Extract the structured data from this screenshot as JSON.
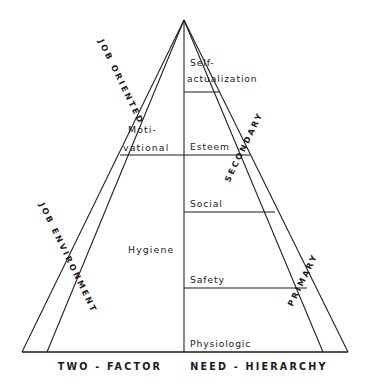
{
  "diagram": {
    "background_color": "#ffffff",
    "line_color": "#1a1a1a",
    "text_color": "#1a1a1a"
  },
  "captions": {
    "left": "TWO - FACTOR",
    "right": "NEED - HIERARCHY"
  },
  "bands": {
    "left_upper": "JOB ORIENTED",
    "left_lower": "JOB ENVIRONMENT",
    "right_upper": "SECONDARY",
    "right_lower": "PRIMARY"
  },
  "two_factor": {
    "motivational_line1": "Moti-",
    "motivational_line2": "vational",
    "hygiene": "Hygiene"
  },
  "need_hierarchy": {
    "self_actualization_line1": "Self-",
    "self_actualization_line2": "actualization",
    "esteem": "Esteem",
    "social": "Social",
    "safety": "Safety",
    "physiologic": "Physiologic"
  }
}
